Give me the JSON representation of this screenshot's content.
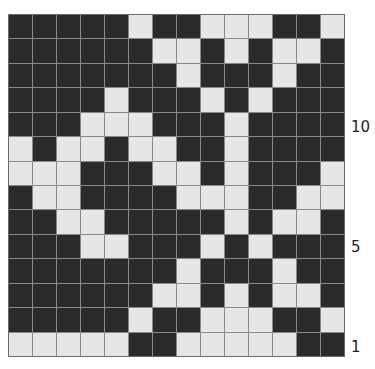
{
  "chart": {
    "title": "",
    "columns": 14,
    "rows": 14,
    "colors": {
      "dark": "#2b2b2b",
      "light": "#e6e6e6",
      "grid": "#8a8a8a"
    },
    "legend": {
      "D": "dark stitch",
      "L": "light stitch"
    },
    "row_order": "top-to-bottom; row numbers count from bottom (row 14 at top, row 1 at bottom)",
    "grid": [
      "DDDDDLDDLLLDDL",
      "DDDDDDLLDLDLLD",
      "DDDDDDDLDDDLDD",
      "DDDDLDDDLDLDDD",
      "DDDLLLDDDLDDDD",
      "LDLLDLLDDLDDDD",
      "LLLDDDLLDLDDDL",
      "DLLDDDDLLLDDLL",
      "DDLLDDDDDLDLLD",
      "DDDLLDDDLDLDDD",
      "DDDDDDDLDDDLDD",
      "DDDDDDLLDLDLLD",
      "DDDDDLDDLLLDDL",
      "LLLLLDDLLLLLDD"
    ]
  },
  "row_labels": [
    {
      "text": "10",
      "row_from_bottom": 10
    },
    {
      "text": "5",
      "row_from_bottom": 5
    },
    {
      "text": "1",
      "row_from_bottom": 1
    }
  ]
}
